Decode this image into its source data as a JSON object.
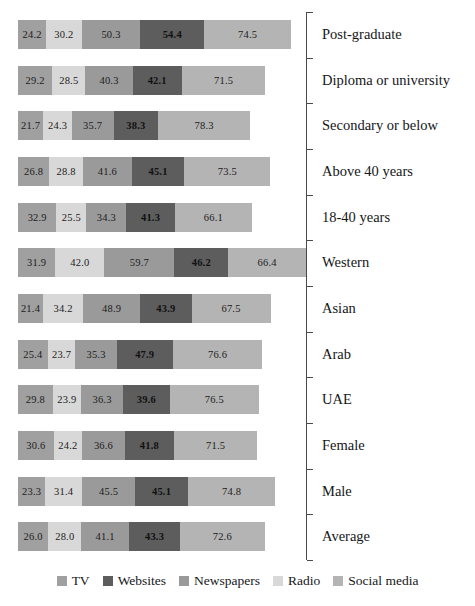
{
  "chart_data": {
    "type": "bar",
    "orientation": "horizontal",
    "stacked": true,
    "title": "",
    "xlabel": "",
    "ylabel": "",
    "grid": false,
    "legend_position": "bottom",
    "categories": [
      "Post-graduate",
      "Diploma or university",
      "Secondary or below",
      "Above 40 years",
      "18-40 years",
      "Western",
      "Asian",
      "Arab",
      "UAE",
      "Female",
      "Male",
      "Average"
    ],
    "series": [
      {
        "name": "TV",
        "color": "#a0a0a0",
        "values": [
          24.2,
          29.2,
          21.7,
          26.8,
          32.9,
          31.9,
          21.4,
          25.4,
          29.8,
          30.6,
          23.3,
          26.0
        ]
      },
      {
        "name": "Websites",
        "color": "#d8d8d8",
        "values": [
          30.2,
          28.5,
          24.3,
          28.8,
          25.5,
          42.0,
          34.2,
          23.7,
          23.9,
          24.2,
          31.4,
          28.0
        ]
      },
      {
        "name": "Newspapers",
        "color": "#9a9a9a",
        "values": [
          50.3,
          40.3,
          35.7,
          41.6,
          34.3,
          59.7,
          48.9,
          35.3,
          36.3,
          36.6,
          45.5,
          41.1
        ]
      },
      {
        "name": "Radio",
        "color": "#5d5d5d",
        "values": [
          54.4,
          42.1,
          38.3,
          45.1,
          41.3,
          46.2,
          43.9,
          47.9,
          39.6,
          41.8,
          45.1,
          43.3
        ]
      },
      {
        "name": "Social media",
        "color": "#b4b4b4",
        "values": [
          74.5,
          71.5,
          78.3,
          73.5,
          66.1,
          66.4,
          67.5,
          76.6,
          76.5,
          71.5,
          74.8,
          72.6
        ]
      }
    ],
    "totals": [
      233.6,
      211.6,
      198.3,
      215.8,
      200.1,
      246.2,
      215.9,
      208.9,
      206.1,
      204.7,
      220.1,
      211.0
    ],
    "legend": [
      {
        "label": "TV",
        "color": "#a0a0a0"
      },
      {
        "label": "Websites",
        "color": "#5d5d5d"
      },
      {
        "label": "Newspapers",
        "color": "#9a9a9a"
      },
      {
        "label": "Radio",
        "color": "#d8d8d8"
      },
      {
        "label": "Social media",
        "color": "#b4b4b4"
      }
    ]
  }
}
